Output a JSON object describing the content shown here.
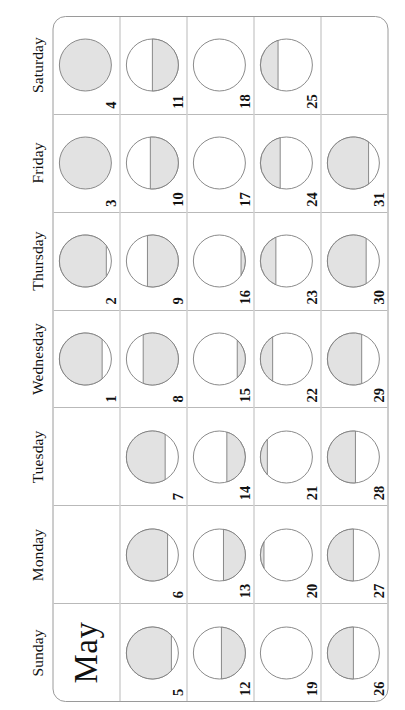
{
  "calendar": {
    "month_title": "May",
    "weekday_headers": [
      "Sunday",
      "Monday",
      "Tuesday",
      "Wednesday",
      "Thursday",
      "Friday",
      "Saturday"
    ],
    "moon_fill_color": "#e2e2e2",
    "moon_outline_color": "#7d7d7d",
    "grid_line_color": "#b9b9b9",
    "frame_color": "#9a9a9a",
    "weeks": [
      [
        {
          "day": "",
          "kind": "title"
        },
        {
          "day": "",
          "kind": "empty"
        },
        {
          "day": "",
          "kind": "empty"
        },
        {
          "day": "1",
          "illumination": 88,
          "shaded_side": "top"
        },
        {
          "day": "2",
          "illumination": 95,
          "shaded_side": "top"
        },
        {
          "day": "3",
          "illumination": 100,
          "shaded_side": "top"
        },
        {
          "day": "4",
          "illumination": 100,
          "shaded_side": "top"
        }
      ],
      [
        {
          "day": "5",
          "illumination": 92,
          "shaded_side": "top"
        },
        {
          "day": "6",
          "illumination": 85,
          "shaded_side": "top"
        },
        {
          "day": "7",
          "illumination": 80,
          "shaded_side": "top"
        },
        {
          "day": "8",
          "illumination": 72,
          "shaded_side": "bottom"
        },
        {
          "day": "9",
          "illumination": 62,
          "shaded_side": "bottom"
        },
        {
          "day": "10",
          "illumination": 55,
          "shaded_side": "bottom"
        },
        {
          "day": "11",
          "illumination": 50,
          "shaded_side": "bottom"
        }
      ],
      [
        {
          "day": "12",
          "illumination": 45,
          "shaded_side": "bottom"
        },
        {
          "day": "13",
          "illumination": 40,
          "shaded_side": "bottom"
        },
        {
          "day": "14",
          "illumination": 32,
          "shaded_side": "bottom"
        },
        {
          "day": "15",
          "illumination": 10,
          "shaded_side": "bottom"
        },
        {
          "day": "16",
          "illumination": 4,
          "shaded_side": "bottom"
        },
        {
          "day": "17",
          "illumination": 0,
          "shaded_side": "bottom"
        },
        {
          "day": "18",
          "illumination": 0,
          "shaded_side": "bottom"
        }
      ],
      [
        {
          "day": "19",
          "illumination": 0,
          "shaded_side": "top"
        },
        {
          "day": "20",
          "illumination": 3,
          "shaded_side": "top"
        },
        {
          "day": "21",
          "illumination": 8,
          "shaded_side": "top"
        },
        {
          "day": "22",
          "illumination": 18,
          "shaded_side": "top"
        },
        {
          "day": "23",
          "illumination": 25,
          "shaded_side": "top"
        },
        {
          "day": "24",
          "illumination": 35,
          "shaded_side": "top"
        },
        {
          "day": "25",
          "illumination": 30,
          "shaded_side": "top"
        }
      ],
      [
        {
          "day": "26",
          "illumination": 50,
          "shaded_side": "top"
        },
        {
          "day": "27",
          "illumination": 50,
          "shaded_side": "top"
        },
        {
          "day": "28",
          "illumination": 55,
          "shaded_side": "top"
        },
        {
          "day": "29",
          "illumination": 70,
          "shaded_side": "top"
        },
        {
          "day": "30",
          "illumination": 80,
          "shaded_side": "top"
        },
        {
          "day": "31",
          "illumination": 85,
          "shaded_side": "top"
        },
        {
          "day": "",
          "kind": "empty"
        }
      ]
    ]
  }
}
